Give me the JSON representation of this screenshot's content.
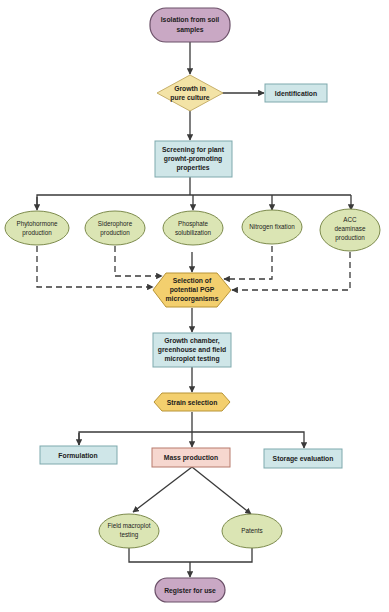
{
  "diagram": {
    "type": "flowchart",
    "colors": {
      "terminal_fill": "#c9a8c4",
      "terminal_stroke": "#6b5068",
      "decision_fill": "#f3e3a6",
      "process_fill": "#cfe6e8",
      "process_stroke": "#7ea9ad",
      "property_fill": "#dbe5b4",
      "property_stroke": "#7d8b4d",
      "hexagon_fill": "#f3cf6e",
      "hexagon_stroke": "#b89436",
      "mass_fill": "#f6d7cf",
      "mass_stroke": "#b77b6c",
      "line": "#3a3a3a"
    },
    "nodes": {
      "isolation": {
        "lines": [
          "Isolation from soil",
          "samples"
        ],
        "shape": "rounded-pill"
      },
      "growth_pure": {
        "lines": [
          "Growth in",
          "pure culture"
        ],
        "shape": "diamond"
      },
      "identification": {
        "lines": [
          "Identification"
        ],
        "shape": "rectangle"
      },
      "screening": {
        "lines": [
          "Screening for plant",
          "growht-promoting",
          "properties"
        ],
        "shape": "rectangle"
      },
      "properties": [
        {
          "lines": [
            "Phytohormone",
            "production"
          ]
        },
        {
          "lines": [
            "Siderophore",
            "production"
          ]
        },
        {
          "lines": [
            "Phosphate",
            "solubilization"
          ]
        },
        {
          "lines": [
            "Nitrogen fixation"
          ]
        },
        {
          "lines": [
            "ACC",
            "deaminase",
            "production"
          ]
        }
      ],
      "selection_pgp": {
        "lines": [
          "Selection of",
          "potential PGP",
          "microorganisms"
        ],
        "shape": "hexagon"
      },
      "testing": {
        "lines": [
          "Growth chamber,",
          "greenhouse and field",
          "microplot testing"
        ],
        "shape": "rectangle"
      },
      "strain_selection": {
        "lines": [
          "Strain selection"
        ],
        "shape": "hexagon"
      },
      "formulation": {
        "lines": [
          "Formulation"
        ],
        "shape": "rectangle"
      },
      "mass_production": {
        "lines": [
          "Mass production"
        ],
        "shape": "rectangle"
      },
      "storage": {
        "lines": [
          "Storage evaluation"
        ],
        "shape": "rectangle"
      },
      "field_macroplot": {
        "lines": [
          "Field macroplot",
          "testing"
        ],
        "shape": "ellipse"
      },
      "patents": {
        "lines": [
          "Patents"
        ],
        "shape": "ellipse"
      },
      "register": {
        "lines": [
          "Register for use"
        ],
        "shape": "rounded-pill"
      }
    }
  }
}
